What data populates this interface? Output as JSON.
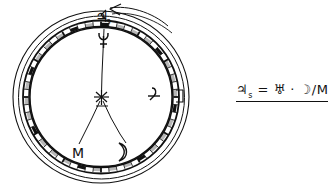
{
  "document": {
    "kind": "hand-drawn astronomical diagram",
    "background_color": "#ffffff",
    "ink_color": "#111111"
  },
  "diagram": {
    "title": "",
    "outer_ring": {
      "label_top": "♃s",
      "rotation_arrow": "counterclockwise-arrow"
    },
    "dial_band": {
      "description": "tick-marked graduated band between inner and outer circle",
      "tick_count": 60,
      "major_tick_count": 12
    },
    "center": {
      "marker": "asterisk-star",
      "rays": 2
    },
    "symbols": [
      {
        "name": "uranus-symbol",
        "text": "♅",
        "position": "top-inside",
        "x": 108,
        "y": 41
      },
      {
        "name": "jupiter-symbol",
        "text": "♃",
        "position": "right-inside",
        "x": 156,
        "y": 97
      },
      {
        "name": "mars-label",
        "text": "M",
        "position": "lower-left",
        "x": 79,
        "y": 152
      },
      {
        "name": "moon-symbol",
        "text": "☽",
        "position": "lower-right",
        "x": 124,
        "y": 150
      }
    ],
    "top_label": {
      "text": "♃",
      "subscript": "s"
    }
  },
  "formula": {
    "lhs": "♃",
    "lhs_subscript": "s",
    "equals": "=",
    "term1": "♅",
    "dot": "·",
    "term2": "☽",
    "slash": "/",
    "term3": "M",
    "full_text": "♃s = ♅ · ☽/M"
  }
}
